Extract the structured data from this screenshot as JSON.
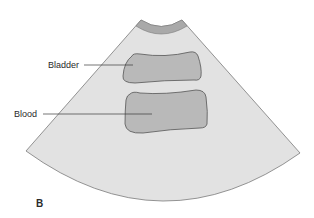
{
  "figure": {
    "panel_letter": "B",
    "labels": {
      "bladder": "Bladder",
      "blood": "Blood"
    },
    "colors": {
      "background": "#ffffff",
      "fan_fill": "#e2e2e2",
      "fan_stroke": "#7a7a7a",
      "transducer_band": "#a9a9a9",
      "organ_fill": "#b9b9b9",
      "organ_stroke": "#555555",
      "leader_line": "#3a3a3a",
      "text": "#2a2a2a"
    }
  }
}
